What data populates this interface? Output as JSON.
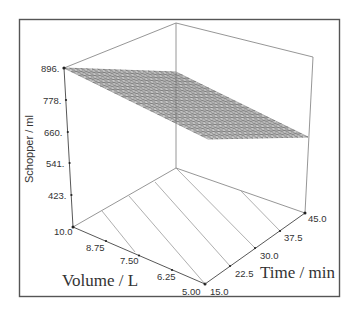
{
  "chart_data": {
    "type": "surface3d",
    "title": "",
    "zlabel": "Schopper / ml",
    "xlabel": "Volume / L",
    "ylabel": "Time / min",
    "z_ticks": [
      "896.",
      "778.",
      "660.",
      "541.",
      "423."
    ],
    "x_ticks": [
      "10.0",
      "8.75",
      "7.50",
      "6.25",
      "5.00"
    ],
    "y_ticks": [
      "15.0",
      "22.5",
      "30.0",
      "37.5",
      "45.0"
    ],
    "zlim": [
      423,
      896
    ],
    "xlim": [
      5.0,
      10.0
    ],
    "ylim": [
      15.0,
      45.0
    ],
    "surface_corners": [
      {
        "volume": 10.0,
        "time": 15.0,
        "schopper": 896
      },
      {
        "volume": 10.0,
        "time": 45.0,
        "schopper": 870
      },
      {
        "volume": 5.0,
        "time": 45.0,
        "schopper": 560
      },
      {
        "volume": 5.0,
        "time": 15.0,
        "schopper": 580
      }
    ],
    "floor_contours": 5,
    "mesh_resolution": 20,
    "grid": false,
    "legend": "none"
  }
}
